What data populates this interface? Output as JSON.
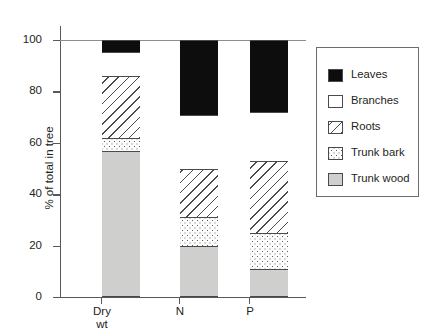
{
  "chart_data": {
    "type": "bar",
    "subtype": "stacked-bar-100",
    "title": "",
    "xlabel": "",
    "ylabel": "% of total in tree",
    "ylim": [
      0,
      100
    ],
    "yticks": [
      0,
      20,
      40,
      60,
      80,
      100
    ],
    "ytick_labels": [
      "0",
      "20",
      "40",
      "60",
      "80",
      "100"
    ],
    "grid": false,
    "legend_position": "right",
    "categories": [
      "Dry\nwt",
      "N",
      "P"
    ],
    "category_labels_plain": [
      "Dry wt",
      "N",
      "P"
    ],
    "series": [
      {
        "name": "Trunk wood",
        "values": [
          57,
          20,
          11
        ],
        "cumulative_top": [
          57,
          20,
          11
        ]
      },
      {
        "name": "Trunk bark",
        "values": [
          5,
          11,
          14
        ],
        "cumulative_top": [
          62,
          31,
          25
        ]
      },
      {
        "name": "Roots",
        "values": [
          24,
          19,
          28
        ],
        "cumulative_top": [
          86,
          50,
          53
        ]
      },
      {
        "name": "Branches",
        "values": [
          9.5,
          21,
          19
        ],
        "cumulative_top": [
          95.5,
          71,
          72
        ]
      },
      {
        "name": "Leaves",
        "values": [
          4.5,
          29,
          28
        ],
        "cumulative_top": [
          100,
          100,
          100
        ]
      }
    ]
  },
  "legend": {
    "items": [
      {
        "label": "Leaves",
        "pattern": "solid-black",
        "swatch_class": "fill-leaves"
      },
      {
        "label": "Branches",
        "pattern": "white",
        "swatch_class": "fill-branches"
      },
      {
        "label": "Roots",
        "pattern": "diagonal-hatch",
        "swatch_class": "fill-roots"
      },
      {
        "label": "Trunk bark",
        "pattern": "stipple-dots",
        "swatch_class": "fill-bark"
      },
      {
        "label": "Trunk wood",
        "pattern": "solid-gray",
        "swatch_class": "fill-wood"
      }
    ]
  },
  "colors": {
    "leaves": "#0d0d0d",
    "branches": "#ffffff",
    "roots_line": "#4a4a4c",
    "trunk_bark_dot": "#5c5c5e",
    "trunk_wood": "#cfcfcd",
    "axis": "#58585a",
    "text": "#231f20"
  }
}
